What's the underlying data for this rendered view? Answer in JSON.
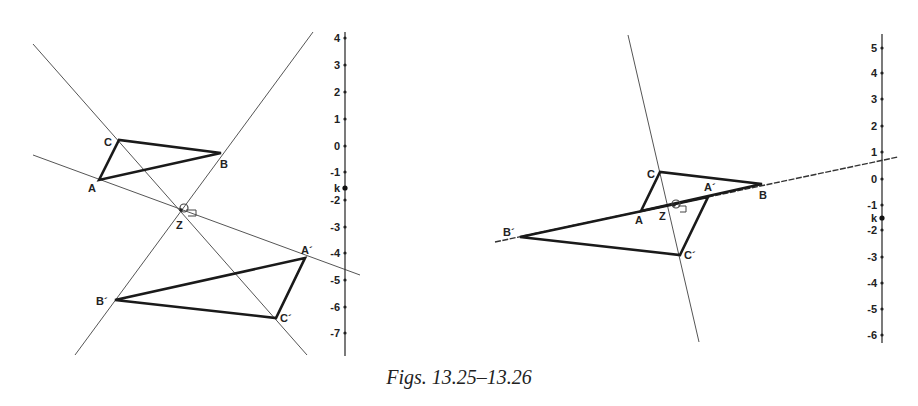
{
  "caption": "Figs. 13.25–13.26",
  "figures": [
    {
      "id": "fig-13-25",
      "points": {
        "A": "A",
        "B": "B",
        "C": "C",
        "A_prime": "A´",
        "B_prime": "B´",
        "C_prime": "C´",
        "Z": "Z"
      },
      "axis": {
        "ticks": [
          "4",
          "3",
          "2",
          "1",
          "0",
          "-1",
          "-2",
          "-3",
          "-4",
          "-5",
          "-6",
          "-7"
        ],
        "marker_label": "k"
      },
      "angle_mark": "1"
    },
    {
      "id": "fig-13-26",
      "points": {
        "A": "A",
        "B": "B",
        "C": "C",
        "A_prime": "A´",
        "B_prime": "B´",
        "C_prime": "C´",
        "Z": "Z"
      },
      "axis": {
        "ticks": [
          "5",
          "4",
          "3",
          "2",
          "1",
          "0",
          "-1",
          "-2",
          "-3",
          "-4",
          "-5",
          "-6"
        ],
        "marker_label": "k"
      },
      "angle_mark": "1"
    }
  ]
}
